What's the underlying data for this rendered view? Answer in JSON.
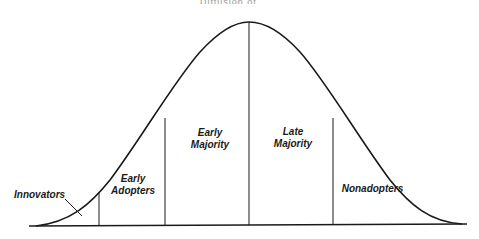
{
  "diagram": {
    "title_cut": "Diffusion of Innovations",
    "segments": [
      {
        "label_line1": "Innovators",
        "label_line2": ""
      },
      {
        "label_line1": "Early",
        "label_line2": "Adopters"
      },
      {
        "label_line1": "Early",
        "label_line2": "Majority"
      },
      {
        "label_line1": "Late",
        "label_line2": "Majority"
      },
      {
        "label_line1": "Nonadopters",
        "label_line2": ""
      }
    ],
    "line_color": "#1a1a1a"
  }
}
